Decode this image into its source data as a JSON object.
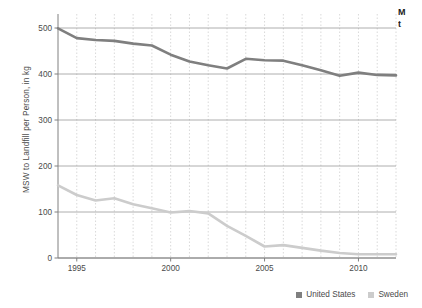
{
  "chart_data": {
    "type": "line",
    "title": "",
    "xlabel": "",
    "ylabel": "MSW to Landfill per Person, in kg",
    "xlim": [
      1994,
      2012
    ],
    "ylim": [
      0,
      500
    ],
    "grid": true,
    "legend_position": "bottom-right",
    "x": [
      1994,
      1995,
      1996,
      1997,
      1998,
      1999,
      2000,
      2001,
      2002,
      2003,
      2004,
      2005,
      2006,
      2007,
      2008,
      2009,
      2010,
      2011,
      2012
    ],
    "xticks": [
      1995,
      2000,
      2005,
      2010
    ],
    "xtick_labels": [
      "1995",
      "2000",
      "2005",
      "2010"
    ],
    "yticks": [
      0,
      100,
      200,
      300,
      400,
      500
    ],
    "ytick_labels": [
      "0",
      "100",
      "200",
      "300",
      "400",
      "500"
    ],
    "series": [
      {
        "name": "United States",
        "color": "#7f7f7f",
        "values": [
          499,
          478,
          474,
          472,
          466,
          462,
          442,
          427,
          419,
          412,
          433,
          430,
          429,
          419,
          408,
          396,
          403,
          398,
          397
        ]
      },
      {
        "name": "Sweden",
        "color": "#cccccc",
        "values": [
          158,
          137,
          125,
          130,
          117,
          108,
          99,
          102,
          97,
          70,
          48,
          25,
          28,
          22,
          16,
          11,
          8,
          8,
          8
        ]
      }
    ]
  },
  "axis": {
    "y_label": "MSW to Landfill per Person, in kg",
    "y_ticks": [
      "500",
      "400",
      "300",
      "200",
      "100",
      "0"
    ],
    "x_ticks": [
      "1995",
      "2000",
      "2005",
      "2010"
    ]
  },
  "legend": {
    "entries": [
      {
        "label": "United States",
        "color": "#7f7f7f"
      },
      {
        "label": "Sweden",
        "color": "#cccccc"
      }
    ]
  },
  "title_block": {
    "line1": "M",
    "line2": "t"
  },
  "colors": {
    "united_states": "#7f7f7f",
    "sweden": "#cccccc",
    "gridline_major": "#999999",
    "gridline_minor": "#cfcfcf",
    "axis": "#808080",
    "text": "#4a4a4a"
  }
}
